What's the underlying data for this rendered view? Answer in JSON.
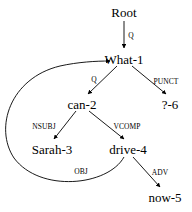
{
  "diagram": {
    "type": "dependency-parse-tree",
    "sentence": "What can Sarah drive now ?",
    "stroke_color": "#000000",
    "background_color": "#ffffff",
    "nodes": [
      {
        "id": "root",
        "label": "Root",
        "x": 124,
        "y": 12
      },
      {
        "id": "what1",
        "label": "What-1",
        "x": 124,
        "y": 59
      },
      {
        "id": "can2",
        "label": "can-2",
        "x": 82,
        "y": 104
      },
      {
        "id": "punct6",
        "label": "?-6",
        "x": 170,
        "y": 104
      },
      {
        "id": "sarah3",
        "label": "Sarah-3",
        "x": 52,
        "y": 149
      },
      {
        "id": "drive4",
        "label": "drive-4",
        "x": 128,
        "y": 149
      },
      {
        "id": "now5",
        "label": "now-5",
        "x": 165,
        "y": 197
      }
    ],
    "edges": [
      {
        "id": "e-root-what",
        "from": "root",
        "to": "what1",
        "label": "Q",
        "label_x": 131,
        "label_y": 36
      },
      {
        "id": "e-what-can",
        "from": "what1",
        "to": "can2",
        "label": "Q",
        "label_x": 94,
        "label_y": 80
      },
      {
        "id": "e-what-punct",
        "from": "what1",
        "to": "punct6",
        "label": "PUNCT",
        "label_x": 166,
        "label_y": 82
      },
      {
        "id": "e-can-sarah",
        "from": "can2",
        "to": "sarah3",
        "label": "NSUBJ",
        "label_x": 44,
        "label_y": 127
      },
      {
        "id": "e-can-drive",
        "from": "can2",
        "to": "drive4",
        "label": "VCOMP",
        "label_x": 127,
        "label_y": 127
      },
      {
        "id": "e-drive-what",
        "from": "drive4",
        "to": "what1",
        "label": "OBJ",
        "label_x": 81,
        "label_y": 172
      },
      {
        "id": "e-drive-now",
        "from": "drive4",
        "to": "now5",
        "label": "ADV",
        "label_x": 160,
        "label_y": 173
      }
    ]
  }
}
